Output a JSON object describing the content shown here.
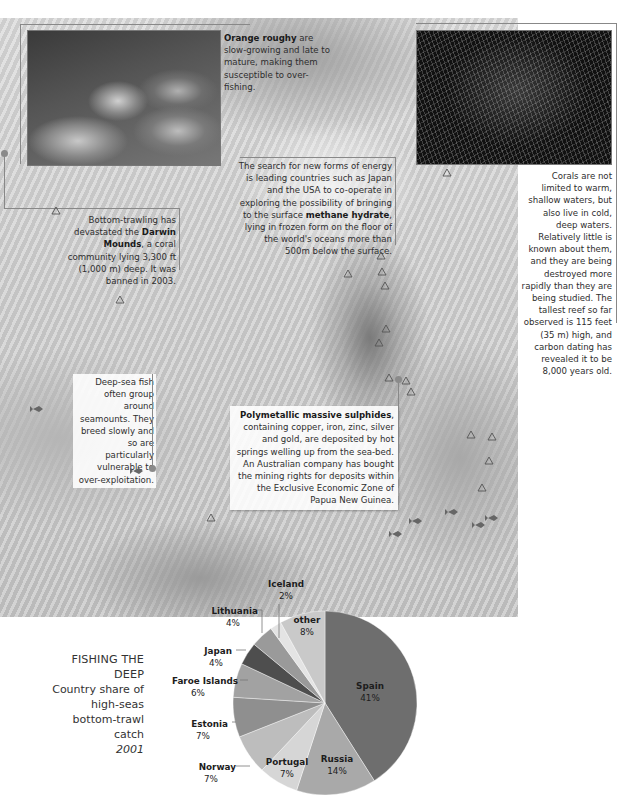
{
  "captions": {
    "orange_roughy": {
      "bold": "Orange roughy",
      "text": " are slow-growing and late to mature, making them susceptible to over-fishing."
    },
    "methane": {
      "pre": "The search for new forms of energy is leading countries such as Japan and the USA to co-operate in exploring the possibility of bringing to the surface ",
      "bold": "methane hydrate",
      "post": ", lying in frozen form on the floor of the world's oceans more than 500m below the surface."
    },
    "darwin": {
      "pre": "Bottom-trawling has devastated the ",
      "bold": "Darwin Mounds",
      "post": ", a coral community lying 3,300 ft (1,000 m) deep. It was banned in 2003."
    },
    "corals": {
      "text": "Corals are not limited to warm, shallow waters, but also live in cold, deep waters. Relatively little is known about them, and they are being destroyed more rapidly than they are being studied. The tallest reef so far observed is 115 feet (35 m) high, and carbon dating has revealed it to be 8,000 years old."
    },
    "deep_sea_fish": {
      "text": "Deep-sea fish often group around seamounts. They breed slowly and so are particularly vulnerable to over-exploitation."
    },
    "sulphides": {
      "bold": "Polymetallic massive sulphides",
      "text": ", containing copper, iron, zinc, silver and gold, are deposited by hot springs welling up from the sea-bed. An Australian company has bought the mining rights for deposits within the Exclusive Economic Zone of Papua New Guinea."
    }
  },
  "icons": {
    "marker": "triangle-coral-marker",
    "fish": "fish-icon",
    "pointer": "leader-dot"
  },
  "chart_title": {
    "line1": "FISHING THE DEEP",
    "line2": "Country share of",
    "line3": "high-seas",
    "line4": "bottom-trawl catch",
    "line5": "2001"
  },
  "chart_data": {
    "type": "pie",
    "title": "FISHING THE DEEP",
    "subtitle": "Country share of high-seas bottom-trawl catch 2001",
    "unit": "%",
    "categories": [
      "Spain",
      "Russia",
      "Portugal",
      "Norway",
      "Estonia",
      "Faroe Islands",
      "Japan",
      "Lithuania",
      "Iceland",
      "other"
    ],
    "values": [
      41,
      14,
      7,
      7,
      7,
      6,
      4,
      4,
      2,
      8
    ],
    "labels": [
      "41%",
      "14%",
      "7%",
      "7%",
      "7%",
      "6%",
      "4%",
      "4%",
      "2%",
      "8%"
    ],
    "colors": [
      "#6e6e6e",
      "#a9a9a9",
      "#d6d6d6",
      "#bdbdbd",
      "#8f8f8f",
      "#a2a2a2",
      "#4e4e4e",
      "#9a9a9a",
      "#e4e4e4",
      "#c9c9c9"
    ],
    "start_angle_deg": 0,
    "direction": "clockwise from 12 o'clock"
  }
}
